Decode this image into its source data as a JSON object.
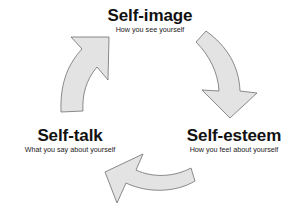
{
  "diagram": {
    "type": "cycle",
    "nodes": [
      {
        "id": "self-image",
        "title": "Self-image",
        "subtitle": "How you see yourself"
      },
      {
        "id": "self-esteem",
        "title": "Self-esteem",
        "subtitle": "How you feel about yourself"
      },
      {
        "id": "self-talk",
        "title": "Self-talk",
        "subtitle": "What you say about yourself"
      }
    ],
    "edges": [
      {
        "from": "self-image",
        "to": "self-esteem"
      },
      {
        "from": "self-esteem",
        "to": "self-talk"
      },
      {
        "from": "self-talk",
        "to": "self-image"
      }
    ],
    "colors": {
      "arrow_fill": "#e3e3e3",
      "arrow_stroke": "#6e6e6e",
      "text": "#111111",
      "background": "#ffffff"
    }
  }
}
